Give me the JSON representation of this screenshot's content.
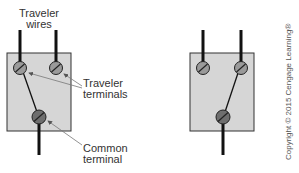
{
  "labels": {
    "traveler_wires_line1": "Traveler",
    "traveler_wires_line2": "wires",
    "traveler_terminals_line1": "Traveler",
    "traveler_terminals_line2": "terminals",
    "common_terminal_line1": "Common",
    "common_terminal_line2": "terminal"
  },
  "copyright": "Copyright © 2015 Cengage Learning®",
  "colors": {
    "box_fill": "#d6d6d6",
    "box_stroke": "#333333",
    "terminal_fill": "#9a9a9a",
    "common_fill": "#6e6e6e",
    "wire": "#111111",
    "leader": "#777777"
  },
  "diagrams": [
    {
      "name": "switch-position-1",
      "connection": "common-to-left-traveler"
    },
    {
      "name": "switch-position-2",
      "connection": "common-to-right-traveler"
    }
  ]
}
